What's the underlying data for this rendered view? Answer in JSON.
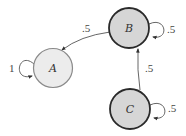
{
  "diagram": {
    "type": "markov-chain",
    "nodes": [
      {
        "id": "A",
        "label": "A",
        "cx": 53,
        "cy": 68,
        "r": 19.5,
        "fill": "#ececec",
        "stroke": "#8a8a8a",
        "stroke_width": 1.2
      },
      {
        "id": "B",
        "label": "B",
        "cx": 129,
        "cy": 28,
        "r": 20,
        "fill": "#d6d6d6",
        "stroke": "#2a2a2a",
        "stroke_width": 1.8
      },
      {
        "id": "C",
        "label": "C",
        "cx": 130,
        "cy": 109,
        "r": 20,
        "fill": "#d6d6d6",
        "stroke": "#2a2a2a",
        "stroke_width": 1.8
      }
    ],
    "edges": [
      {
        "from": "A",
        "to": "A",
        "label": "1",
        "kind": "self-loop"
      },
      {
        "from": "B",
        "to": "B",
        "label": ".5",
        "kind": "self-loop"
      },
      {
        "from": "C",
        "to": "C",
        "label": ".5",
        "kind": "self-loop"
      },
      {
        "from": "B",
        "to": "A",
        "label": ".5",
        "kind": "curve"
      },
      {
        "from": "C",
        "to": "B",
        "label": ".5",
        "kind": "straight"
      }
    ]
  }
}
